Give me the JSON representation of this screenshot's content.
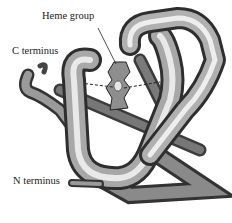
{
  "diagram": {
    "labels": {
      "heme": "Heme group",
      "c_terminus": "C terminus",
      "n_terminus": "N terminus"
    }
  }
}
